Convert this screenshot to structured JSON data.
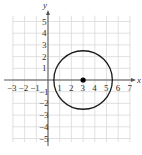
{
  "diagram": {
    "type": "coordinate-plane-circle",
    "axes": {
      "x_label": "x",
      "y_label": "y",
      "x_ticks": [
        "-3",
        "-2",
        "-1",
        "1",
        "2",
        "3",
        "4",
        "5",
        "6",
        "7"
      ],
      "y_ticks": [
        "5",
        "4",
        "3",
        "2",
        "1",
        "-1",
        "-2",
        "-3",
        "-4",
        "-5"
      ],
      "x_range": [
        -3,
        7
      ],
      "y_range": [
        -5,
        5
      ]
    },
    "grid": {
      "on": true,
      "color": "#d9d9d9"
    },
    "circle": {
      "center": [
        3,
        0
      ],
      "radius": 2.5,
      "stroke": "#1a1a1a"
    },
    "center_point": {
      "x": 3,
      "y": 0,
      "color": "#000000"
    }
  }
}
